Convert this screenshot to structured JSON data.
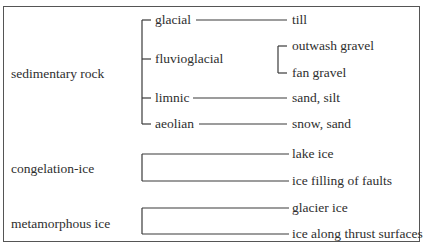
{
  "diagram": {
    "categories": [
      {
        "label": "sedimentary rock",
        "branches": [
          {
            "label": "glacial",
            "results": [
              "till"
            ]
          },
          {
            "label": "fluvioglacial",
            "results": [
              "outwash gravel",
              "fan gravel"
            ]
          },
          {
            "label": "limnic",
            "results": [
              "sand, silt"
            ]
          },
          {
            "label": "aeolian",
            "results": [
              "snow, sand"
            ]
          }
        ]
      },
      {
        "label": "congelation-ice",
        "results": [
          "lake ice",
          "ice filling of faults"
        ]
      },
      {
        "label": "metamorphous ice",
        "results": [
          "glacier ice",
          "ice along thrust surfaces"
        ]
      }
    ]
  }
}
